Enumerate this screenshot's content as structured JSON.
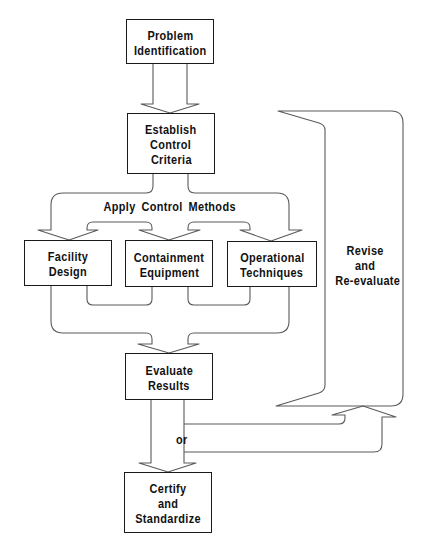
{
  "diagram": {
    "nodes": [
      {
        "lines": [
          "Problem",
          "Identification"
        ]
      },
      {
        "lines": [
          "Establish",
          "Control",
          "Criteria"
        ]
      },
      {
        "lines": [
          "Facility",
          "Design"
        ]
      },
      {
        "lines": [
          "Containment",
          "Equipment"
        ]
      },
      {
        "lines": [
          "Operational",
          "Techniques"
        ]
      },
      {
        "lines": [
          "Evaluate",
          "Results"
        ]
      },
      {
        "lines": [
          "Certify",
          "and",
          "Standardize"
        ]
      }
    ],
    "labels": {
      "apply_control_methods": "Apply Control Methods",
      "revise": [
        "Revise",
        "and",
        "Re-evaluate"
      ],
      "or": "or"
    },
    "edges": [
      {
        "from": "Problem Identification",
        "to": "Establish Control Criteria"
      },
      {
        "from": "Establish Control Criteria",
        "to": "Facility Design",
        "label": "Apply Control Methods"
      },
      {
        "from": "Establish Control Criteria",
        "to": "Containment Equipment",
        "label": "Apply Control Methods"
      },
      {
        "from": "Establish Control Criteria",
        "to": "Operational Techniques",
        "label": "Apply Control Methods"
      },
      {
        "from": "Facility Design",
        "to": "Evaluate Results"
      },
      {
        "from": "Containment Equipment",
        "to": "Evaluate Results"
      },
      {
        "from": "Operational Techniques",
        "to": "Evaluate Results"
      },
      {
        "from": "Evaluate Results",
        "to": "Certify and Standardize",
        "label": "or"
      },
      {
        "from": "Evaluate Results",
        "to": "Establish Control Criteria",
        "label": "Revise and Re-evaluate"
      }
    ]
  },
  "colors": {
    "background": "#ffffff",
    "line": "#5a5a5a",
    "box_border": "#1a1a1a",
    "text": "#111111"
  }
}
